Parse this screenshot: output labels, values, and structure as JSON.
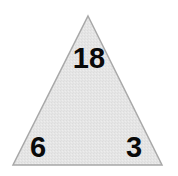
{
  "figure": {
    "type": "number-triangle",
    "shape": {
      "name": "triangle",
      "fill_color": "#e3e3e3",
      "stroke_color": "#a8a8a8",
      "stroke_width": 1.5,
      "points": "88,16 162,165 13,165"
    },
    "background_color": "#ffffff",
    "text_color": "#0a0a0a",
    "numbers": {
      "top": "18",
      "bottom_left": "6",
      "bottom_right": "3"
    }
  }
}
